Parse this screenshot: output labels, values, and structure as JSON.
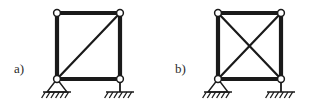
{
  "figure": {
    "background_color": "#ffffff",
    "line_color": "#1a1a1a",
    "node_fill_color": "#ffffff",
    "width": 323,
    "height": 106,
    "panels": [
      {
        "id": "panel-a",
        "label": "a)",
        "label_x": 14,
        "label_y": 73,
        "frame": {
          "left_x": 57,
          "right_x": 120,
          "top_y": 13,
          "bottom_y": 79,
          "member_width": 4.2
        },
        "bracing": {
          "type": "single-diagonal",
          "description": "one diagonal from bottom-left node to top-right node",
          "diagonal_width": 2.2,
          "diagonals": [
            {
              "name": "diagonal-bl-tr",
              "x1": 57,
              "y1": 79,
              "x2": 120,
              "y2": 13
            }
          ]
        },
        "nodes": [
          {
            "name": "node-top-left",
            "cx": 57,
            "cy": 13,
            "r": 3.4
          },
          {
            "name": "node-top-right",
            "cx": 120,
            "cy": 13,
            "r": 3.4
          },
          {
            "name": "node-bottom-left",
            "cx": 57,
            "cy": 79,
            "r": 3.4
          },
          {
            "name": "node-bottom-right",
            "cx": 120,
            "cy": 79,
            "r": 3.4
          }
        ],
        "supports": [
          {
            "name": "support-pinned-left",
            "type": "pinned",
            "apex_x": 57,
            "apex_y": 79,
            "base_y": 92,
            "half_width": 10,
            "ground_y": 92,
            "ground_half_width": 14,
            "hatch_count": 6,
            "hatch_length": 6
          },
          {
            "name": "support-roller-right",
            "type": "vertical-link",
            "apex_x": 120,
            "apex_y": 79,
            "base_y": 92,
            "ground_y": 92,
            "ground_half_width": 14,
            "hatch_count": 6,
            "hatch_length": 6
          }
        ]
      },
      {
        "id": "panel-b",
        "label": "b)",
        "label_x": 175,
        "label_y": 73,
        "frame": {
          "left_x": 218,
          "right_x": 281,
          "top_y": 13,
          "bottom_y": 79,
          "member_width": 4.2
        },
        "bracing": {
          "type": "cross-bracing",
          "description": "two diagonals forming an X between all four corner nodes",
          "diagonal_width": 2.2,
          "diagonals": [
            {
              "name": "diagonal-bl-tr",
              "x1": 218,
              "y1": 79,
              "x2": 281,
              "y2": 13
            },
            {
              "name": "diagonal-tl-br",
              "x1": 218,
              "y1": 13,
              "x2": 281,
              "y2": 79
            }
          ]
        },
        "nodes": [
          {
            "name": "node-top-left",
            "cx": 218,
            "cy": 13,
            "r": 3.4
          },
          {
            "name": "node-top-right",
            "cx": 281,
            "cy": 13,
            "r": 3.4
          },
          {
            "name": "node-bottom-left",
            "cx": 218,
            "cy": 79,
            "r": 3.4
          },
          {
            "name": "node-bottom-right",
            "cx": 281,
            "cy": 79,
            "r": 3.4
          }
        ],
        "supports": [
          {
            "name": "support-pinned-left",
            "type": "pinned",
            "apex_x": 218,
            "apex_y": 79,
            "base_y": 92,
            "half_width": 10,
            "ground_y": 92,
            "ground_half_width": 14,
            "hatch_count": 6,
            "hatch_length": 6
          },
          {
            "name": "support-roller-right",
            "type": "vertical-link",
            "apex_x": 281,
            "apex_y": 79,
            "base_y": 92,
            "ground_y": 92,
            "ground_half_width": 14,
            "hatch_count": 6,
            "hatch_length": 6
          }
        ]
      }
    ]
  }
}
